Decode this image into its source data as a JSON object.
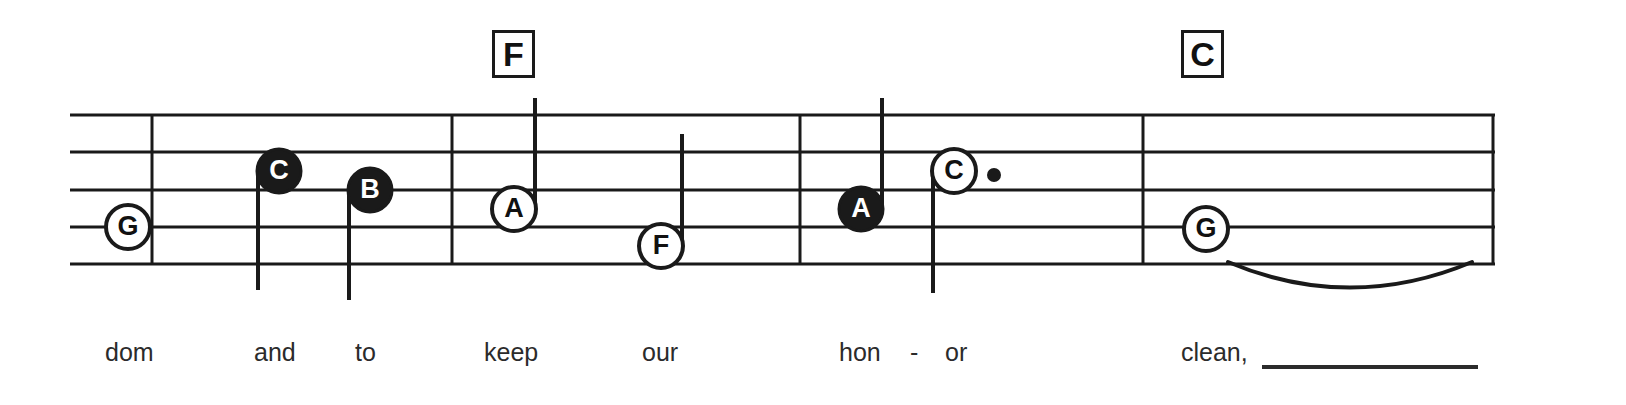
{
  "sheet": {
    "width": 1626,
    "height": 405,
    "background": "#ffffff",
    "ink_color": "#1a1a1a",
    "lyric_color": "#2b2b2b"
  },
  "staff": {
    "left": 70,
    "right": 1495,
    "line_count": 5,
    "line_ys": [
      115,
      152,
      190,
      227,
      264
    ],
    "line_width": 3
  },
  "barlines": [
    {
      "name": "barline-1",
      "x": 152
    },
    {
      "name": "barline-2",
      "x": 452
    },
    {
      "name": "barline-3",
      "x": 800
    },
    {
      "name": "barline-4",
      "x": 1143
    },
    {
      "name": "barline-end",
      "x": 1493
    }
  ],
  "chords": [
    {
      "label": "F",
      "x": 492,
      "y": 30,
      "w": 43,
      "h": 48
    },
    {
      "label": "C",
      "x": 1181,
      "y": 30,
      "w": 43,
      "h": 48
    }
  ],
  "notes": [
    {
      "name": "note-G",
      "label": "G",
      "cx": 128,
      "cy": 227,
      "r": 22,
      "fill": "open",
      "stem": "none",
      "dotted": false
    },
    {
      "name": "note-C",
      "label": "C",
      "cx": 279,
      "cy": 171,
      "r": 22,
      "fill": "filled",
      "stem": "down",
      "stem_end": 290,
      "dotted": false
    },
    {
      "name": "note-B",
      "label": "B",
      "cx": 370,
      "cy": 190,
      "r": 22,
      "fill": "filled",
      "stem": "down",
      "stem_end": 300,
      "dotted": false
    },
    {
      "name": "note-A",
      "label": "A",
      "cx": 514,
      "cy": 209,
      "r": 22,
      "fill": "open",
      "stem": "up",
      "stem_end": 98,
      "dotted": false
    },
    {
      "name": "note-F",
      "label": "F",
      "cx": 661,
      "cy": 246,
      "r": 22,
      "fill": "open",
      "stem": "up",
      "stem_end": 134,
      "dotted": false
    },
    {
      "name": "note-A2",
      "label": "A",
      "cx": 861,
      "cy": 209,
      "r": 22,
      "fill": "filled",
      "stem": "up",
      "stem_end": 98,
      "dotted": false
    },
    {
      "name": "note-C2",
      "label": "C",
      "cx": 954,
      "cy": 171,
      "r": 22,
      "fill": "open",
      "stem": "down",
      "stem_end": 293,
      "dotted": true,
      "dot_x": 994,
      "dot_y": 175
    },
    {
      "name": "note-G2",
      "label": "G",
      "cx": 1206,
      "cy": 229,
      "r": 22,
      "fill": "open",
      "stem": "none",
      "dotted": false
    }
  ],
  "tie": {
    "name": "tie-slur",
    "start_x": 1228,
    "end_x": 1472,
    "y": 262,
    "depth": 32
  },
  "lyrics": [
    {
      "text": "dom",
      "x": 105,
      "y": 340
    },
    {
      "text": "and",
      "x": 254,
      "y": 340
    },
    {
      "text": "to",
      "x": 355,
      "y": 340
    },
    {
      "text": "keep",
      "x": 484,
      "y": 340
    },
    {
      "text": "our",
      "x": 642,
      "y": 340
    },
    {
      "text": "hon",
      "x": 839,
      "y": 340
    },
    {
      "text": "-",
      "x": 910,
      "y": 340
    },
    {
      "text": "or",
      "x": 945,
      "y": 340
    },
    {
      "text": "clean,",
      "x": 1181,
      "y": 340
    }
  ],
  "melisma_line": {
    "name": "melisma-extension-line",
    "x1": 1262,
    "x2": 1478,
    "y": 367,
    "width": 4
  }
}
